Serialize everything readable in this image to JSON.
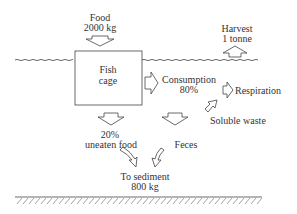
{
  "diagram": {
    "food": {
      "title": "Food",
      "amount": "2000 kg"
    },
    "harvest": {
      "title": "Harvest",
      "amount": "1 tonne"
    },
    "cage": {
      "line1": "Fish",
      "line2": "cage"
    },
    "consumption": {
      "title": "Consumption",
      "percent": "80%"
    },
    "respiration": {
      "title": "Respiration"
    },
    "soluble_waste": {
      "title": "Soluble waste"
    },
    "uneaten": {
      "percent": "20%",
      "title": "uneaten food"
    },
    "feces": {
      "title": "Feces"
    },
    "sediment": {
      "title": "To sediment",
      "amount": "800 kg"
    }
  }
}
